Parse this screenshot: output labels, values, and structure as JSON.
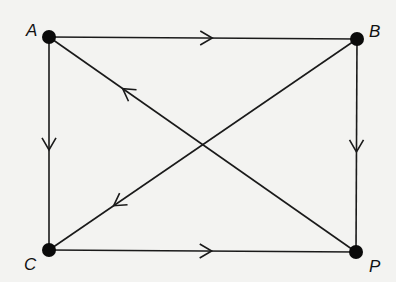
{
  "diagram": {
    "type": "directed-graph",
    "background": "#f3f3f1",
    "stroke_color": "#1a1a1a",
    "node_color": "#0a0a0a",
    "nodes": [
      {
        "id": "A",
        "label": "A",
        "x": 49,
        "y": 37,
        "label_x": 26,
        "label_y": 22
      },
      {
        "id": "B",
        "label": "B",
        "x": 357,
        "y": 39,
        "label_x": 369,
        "label_y": 23
      },
      {
        "id": "C",
        "label": "C",
        "x": 49,
        "y": 250,
        "label_x": 24,
        "label_y": 256
      },
      {
        "id": "P",
        "label": "P",
        "x": 356,
        "y": 252,
        "label_x": 369,
        "label_y": 258
      }
    ],
    "edges": [
      {
        "from": "A",
        "to": "B",
        "arrow_direction": "A→B",
        "arrow_position": 0.53
      },
      {
        "from": "A",
        "to": "C",
        "arrow_direction": "A→C",
        "arrow_position": 0.53
      },
      {
        "from": "B",
        "to": "P",
        "arrow_direction": "B→P",
        "arrow_position": 0.53
      },
      {
        "from": "C",
        "to": "P",
        "arrow_direction": "C→P",
        "arrow_position": 0.53
      },
      {
        "from": "P",
        "to": "A",
        "arrow_direction": "P→A",
        "arrow_position": 0.76
      },
      {
        "from": "B",
        "to": "C",
        "arrow_direction": "B→C",
        "arrow_position": 0.79
      }
    ]
  }
}
